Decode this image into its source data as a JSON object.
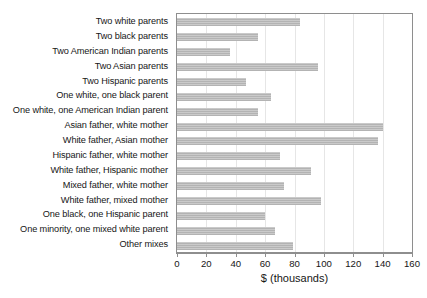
{
  "chart_data": {
    "type": "bar",
    "orientation": "horizontal",
    "title": "",
    "xlabel": "$ (thousands)",
    "ylabel": "",
    "xlim": [
      0,
      160
    ],
    "xticks": [
      0,
      20,
      40,
      60,
      80,
      100,
      120,
      140,
      160
    ],
    "grid": true,
    "grid_axis": "x",
    "legend": false,
    "bar_color": "#b3b3b3",
    "frame_color": "#8e8e8e",
    "categories": [
      "Two white parents",
      "Two black parents",
      "Two American Indian parents",
      "Two Asian parents",
      "Two Hispanic parents",
      "One white, one black parent",
      "One white, one American Indian parent",
      "Asian father, white mother",
      "White father, Asian mother",
      "Hispanic father, white mother",
      "White father, Hispanic mother",
      "Mixed father, white mother",
      "White father, mixed mother",
      "One black, one Hispanic parent",
      "One minority, one mixed white parent",
      "Other mixes"
    ],
    "values": [
      84,
      55,
      36,
      96,
      47,
      64,
      55,
      140,
      137,
      70,
      91,
      73,
      98,
      60,
      67,
      79
    ]
  }
}
